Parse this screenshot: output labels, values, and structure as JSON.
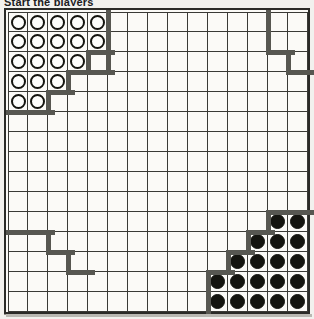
{
  "caption": "Start the players",
  "board": {
    "name": "go-board-diagram",
    "columns": 15,
    "rows": 15,
    "background_color": "#fbfaf7",
    "line_color": "#3a3a36",
    "border_color": "#2b2b28",
    "boundary_color": "#575751",
    "white_stone_color": "#fdfdfb",
    "black_stone_color": "#14140f"
  },
  "stones": [
    {
      "color": "white",
      "row": 0,
      "col": 0
    },
    {
      "color": "white",
      "row": 0,
      "col": 1
    },
    {
      "color": "white",
      "row": 0,
      "col": 2
    },
    {
      "color": "white",
      "row": 0,
      "col": 3
    },
    {
      "color": "white",
      "row": 0,
      "col": 4
    },
    {
      "color": "white",
      "row": 1,
      "col": 0
    },
    {
      "color": "white",
      "row": 1,
      "col": 1
    },
    {
      "color": "white",
      "row": 1,
      "col": 2
    },
    {
      "color": "white",
      "row": 1,
      "col": 3
    },
    {
      "color": "white",
      "row": 1,
      "col": 4
    },
    {
      "color": "white",
      "row": 2,
      "col": 0
    },
    {
      "color": "white",
      "row": 2,
      "col": 1
    },
    {
      "color": "white",
      "row": 2,
      "col": 2
    },
    {
      "color": "white",
      "row": 2,
      "col": 3
    },
    {
      "color": "white",
      "row": 3,
      "col": 0
    },
    {
      "color": "white",
      "row": 3,
      "col": 1
    },
    {
      "color": "white",
      "row": 3,
      "col": 2
    },
    {
      "color": "white",
      "row": 4,
      "col": 0
    },
    {
      "color": "white",
      "row": 4,
      "col": 1
    },
    {
      "color": "black",
      "row": 10,
      "col": 13
    },
    {
      "color": "black",
      "row": 10,
      "col": 14
    },
    {
      "color": "black",
      "row": 11,
      "col": 12
    },
    {
      "color": "black",
      "row": 11,
      "col": 13
    },
    {
      "color": "black",
      "row": 11,
      "col": 14
    },
    {
      "color": "black",
      "row": 12,
      "col": 11
    },
    {
      "color": "black",
      "row": 12,
      "col": 12
    },
    {
      "color": "black",
      "row": 12,
      "col": 13
    },
    {
      "color": "black",
      "row": 12,
      "col": 14
    },
    {
      "color": "black",
      "row": 13,
      "col": 10
    },
    {
      "color": "black",
      "row": 13,
      "col": 11
    },
    {
      "color": "black",
      "row": 13,
      "col": 12
    },
    {
      "color": "black",
      "row": 13,
      "col": 13
    },
    {
      "color": "black",
      "row": 13,
      "col": 14
    },
    {
      "color": "black",
      "row": 14,
      "col": 10
    },
    {
      "color": "black",
      "row": 14,
      "col": 11
    },
    {
      "color": "black",
      "row": 14,
      "col": 12
    },
    {
      "color": "black",
      "row": 14,
      "col": 13
    },
    {
      "color": "black",
      "row": 14,
      "col": 14
    }
  ],
  "boundaries": {
    "white_territory_edge": [
      {
        "orient": "v",
        "x": 100,
        "y": 0,
        "len": 60
      },
      {
        "orient": "h",
        "x": 60,
        "y": 60,
        "len": 45
      },
      {
        "orient": "v",
        "x": 60,
        "y": 60,
        "len": 20
      },
      {
        "orient": "h",
        "x": 40,
        "y": 80,
        "len": 25
      },
      {
        "orient": "v",
        "x": 40,
        "y": 80,
        "len": 20
      },
      {
        "orient": "h",
        "x": 0,
        "y": 100,
        "len": 45
      }
    ],
    "white_outer_edge": [
      {
        "orient": "v",
        "x": 80,
        "y": 40,
        "len": 20
      },
      {
        "orient": "h",
        "x": 80,
        "y": 40,
        "len": 25
      }
    ],
    "upper_right_edge": [
      {
        "orient": "v",
        "x": 260,
        "y": 0,
        "len": 40
      },
      {
        "orient": "h",
        "x": 260,
        "y": 40,
        "len": 25
      },
      {
        "orient": "v",
        "x": 280,
        "y": 40,
        "len": 20
      },
      {
        "orient": "h",
        "x": 280,
        "y": 60,
        "len": 25
      }
    ],
    "lower_left_edge": [
      {
        "orient": "h",
        "x": 0,
        "y": 220,
        "len": 45
      },
      {
        "orient": "v",
        "x": 40,
        "y": 220,
        "len": 20
      },
      {
        "orient": "h",
        "x": 40,
        "y": 240,
        "len": 25
      },
      {
        "orient": "v",
        "x": 60,
        "y": 240,
        "len": 20
      },
      {
        "orient": "h",
        "x": 60,
        "y": 260,
        "len": 25
      }
    ],
    "black_territory_edge": [
      {
        "orient": "h",
        "x": 260,
        "y": 200,
        "len": 45
      },
      {
        "orient": "v",
        "x": 260,
        "y": 200,
        "len": 20
      },
      {
        "orient": "h",
        "x": 240,
        "y": 220,
        "len": 25
      },
      {
        "orient": "v",
        "x": 240,
        "y": 220,
        "len": 20
      },
      {
        "orient": "h",
        "x": 220,
        "y": 240,
        "len": 25
      },
      {
        "orient": "v",
        "x": 220,
        "y": 240,
        "len": 20
      },
      {
        "orient": "h",
        "x": 200,
        "y": 260,
        "len": 25
      },
      {
        "orient": "v",
        "x": 200,
        "y": 260,
        "len": 40
      }
    ]
  }
}
